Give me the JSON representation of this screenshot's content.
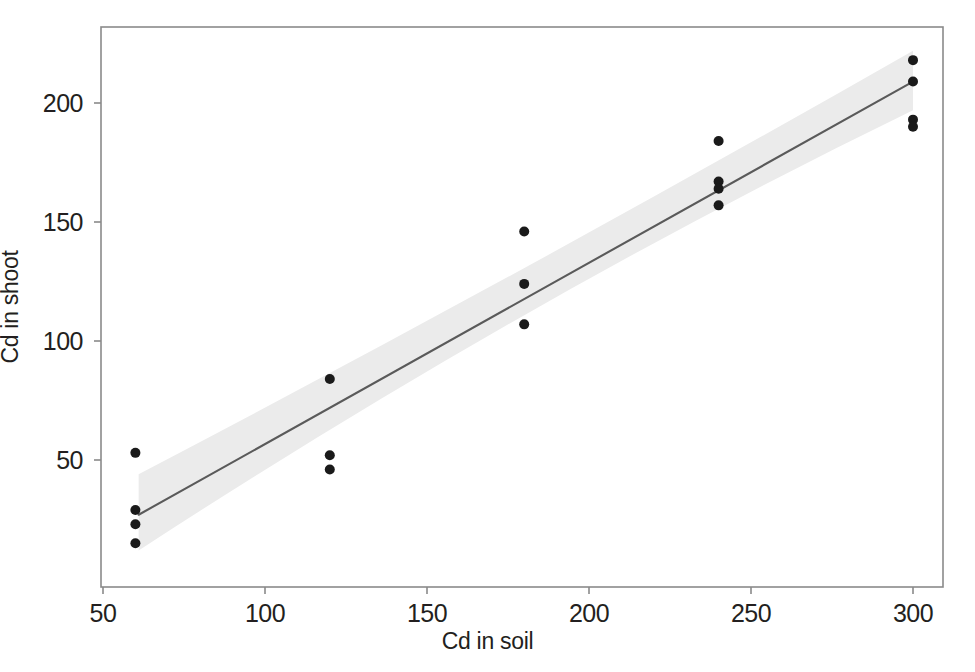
{
  "chart_data": {
    "type": "scatter",
    "title": "",
    "xlabel": "Cd in soil",
    "ylabel": "Cd in shoot",
    "xlim": [
      40,
      310
    ],
    "ylim": [
      10,
      228
    ],
    "xticks": [
      50,
      100,
      150,
      200,
      250,
      300
    ],
    "yticks": [
      50,
      100,
      150,
      200
    ],
    "grid": false,
    "legend": null,
    "frame": true,
    "points": [
      {
        "x": 60,
        "y": 53
      },
      {
        "x": 60,
        "y": 29
      },
      {
        "x": 60,
        "y": 23
      },
      {
        "x": 60,
        "y": 15
      },
      {
        "x": 120,
        "y": 84
      },
      {
        "x": 120,
        "y": 52
      },
      {
        "x": 120,
        "y": 46
      },
      {
        "x": 180,
        "y": 146
      },
      {
        "x": 180,
        "y": 124
      },
      {
        "x": 180,
        "y": 107
      },
      {
        "x": 240,
        "y": 184
      },
      {
        "x": 240,
        "y": 167
      },
      {
        "x": 240,
        "y": 164
      },
      {
        "x": 240,
        "y": 157
      },
      {
        "x": 300,
        "y": 218
      },
      {
        "x": 300,
        "y": 209
      },
      {
        "x": 300,
        "y": 193
      },
      {
        "x": 300,
        "y": 190
      }
    ],
    "fit_line": {
      "type": "linear-regression",
      "x_start": 61,
      "y_start": 27,
      "x_end": 300,
      "y_end": 209,
      "color": "#5a5a5a"
    },
    "confidence_band": {
      "label": "confidence interval",
      "color": "#ebebeb",
      "x_start": 61,
      "x_end": 300,
      "upper_start": 44,
      "lower_start": 12,
      "upper_mid": 129,
      "lower_mid": 118,
      "upper_end": 222,
      "lower_end": 197
    },
    "point_color": "#1a1a1a",
    "point_size": 5
  },
  "axis": {
    "xtick_labels": [
      "50",
      "100",
      "150",
      "200",
      "250",
      "300"
    ],
    "ytick_labels": [
      "50",
      "100",
      "150",
      "200"
    ],
    "xlabel": "Cd in soil",
    "ylabel": "Cd in shoot"
  }
}
